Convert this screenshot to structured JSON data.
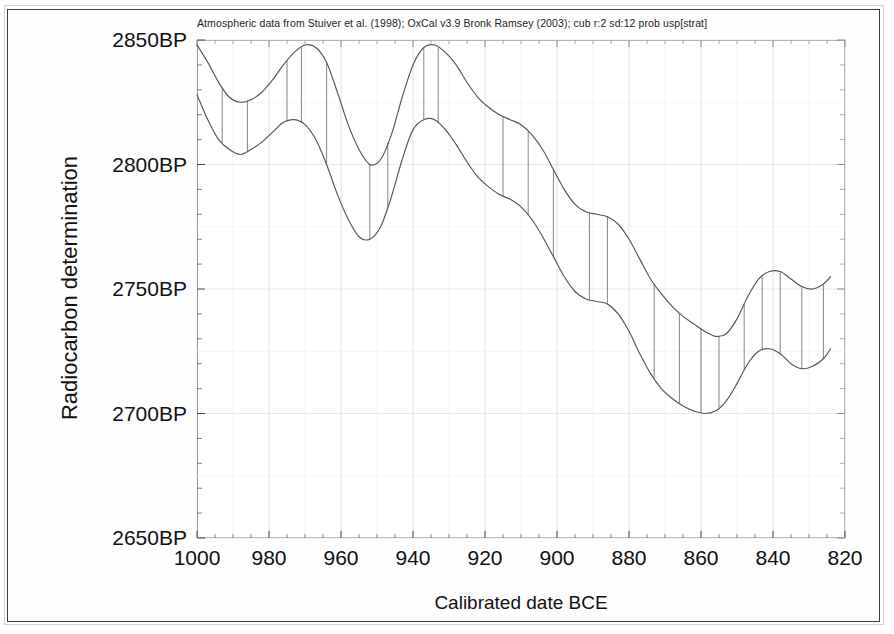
{
  "caption": "Atmospheric data from Stuiver et al. (1998); OxCal v3.9 Bronk Ramsey (2003); cub r:2 sd:12 prob usp[strat]",
  "axes": {
    "ylabel": "Radiocarbon determination",
    "xlabel": "Calibrated date BCE"
  },
  "chart_data": {
    "type": "line",
    "title": "Atmospheric data from Stuiver et al. (1998); OxCal v3.9 Bronk Ramsey (2003); cub r:2 sd:12 prob usp[strat]",
    "xlabel": "Calibrated date BCE",
    "ylabel": "Radiocarbon determination",
    "xlim": [
      1000,
      820
    ],
    "ylim": [
      2650,
      2850
    ],
    "x_tick_labels": [
      "1000",
      "980",
      "960",
      "940",
      "920",
      "900",
      "880",
      "860",
      "840",
      "820"
    ],
    "x_ticks": [
      1000,
      980,
      960,
      940,
      920,
      900,
      880,
      860,
      840,
      820
    ],
    "y_tick_labels": [
      "2850BP",
      "2800BP",
      "2750BP",
      "2700BP",
      "2650BP"
    ],
    "y_ticks": [
      2850,
      2800,
      2750,
      2700,
      2650
    ],
    "x_minor_tick_step": 5,
    "y_minor_tick_step": 10,
    "x_axis_direction": "decreasing",
    "grid": true,
    "legend": "none",
    "series": [
      {
        "name": "Calibration curve upper bound (+1 sigma)",
        "x": [
          1000,
          997,
          994,
          991,
          988,
          985,
          982,
          979,
          976,
          973,
          970,
          967,
          964,
          961,
          958,
          955,
          952,
          949,
          946,
          943,
          940,
          937,
          934,
          931,
          928,
          925,
          922,
          919,
          916,
          913,
          910,
          907,
          904,
          901,
          898,
          895,
          892,
          889,
          886,
          883,
          880,
          877,
          874,
          871,
          868,
          865,
          862,
          859,
          856,
          853,
          850,
          847,
          844,
          841,
          838,
          835,
          832,
          829,
          826,
          824
        ],
        "values": [
          2848,
          2841,
          2833,
          2827,
          2825,
          2826,
          2829,
          2834,
          2840,
          2845,
          2848,
          2847,
          2841,
          2829,
          2816,
          2806,
          2800,
          2802,
          2812,
          2827,
          2840,
          2847,
          2848,
          2845,
          2840,
          2833,
          2827,
          2823,
          2820,
          2818,
          2816,
          2812,
          2806,
          2798,
          2790,
          2784,
          2781,
          2780,
          2779,
          2776,
          2770,
          2762,
          2754,
          2748,
          2743,
          2739,
          2736,
          2733,
          2731,
          2732,
          2738,
          2747,
          2754,
          2757,
          2757,
          2754,
          2751,
          2750,
          2752,
          2755
        ]
      },
      {
        "name": "Calibration curve lower bound (-1 sigma)",
        "x": [
          1000,
          997,
          994,
          991,
          988,
          985,
          982,
          979,
          976,
          973,
          970,
          967,
          964,
          961,
          958,
          955,
          952,
          949,
          946,
          943,
          940,
          937,
          934,
          931,
          928,
          925,
          922,
          919,
          916,
          913,
          910,
          907,
          904,
          901,
          898,
          895,
          892,
          889,
          886,
          883,
          880,
          877,
          874,
          871,
          868,
          865,
          862,
          859,
          856,
          853,
          850,
          847,
          844,
          841,
          838,
          835,
          832,
          829,
          826,
          824
        ],
        "values": [
          2828,
          2818,
          2810,
          2806,
          2804,
          2806,
          2809,
          2813,
          2817,
          2818,
          2816,
          2810,
          2800,
          2788,
          2778,
          2771,
          2770,
          2775,
          2787,
          2802,
          2814,
          2818,
          2818,
          2814,
          2808,
          2801,
          2795,
          2791,
          2788,
          2786,
          2783,
          2778,
          2771,
          2763,
          2755,
          2749,
          2746,
          2745,
          2744,
          2740,
          2733,
          2724,
          2716,
          2710,
          2706,
          2703,
          2701,
          2700,
          2701,
          2705,
          2712,
          2720,
          2725,
          2726,
          2724,
          2720,
          2718,
          2719,
          2722,
          2726
        ]
      }
    ],
    "band_connectors_x": [
      993,
      986,
      975,
      971,
      964,
      952,
      947,
      937,
      933,
      915,
      908,
      901,
      891,
      886,
      873,
      866,
      860,
      855,
      848,
      843,
      838,
      832,
      826
    ]
  }
}
